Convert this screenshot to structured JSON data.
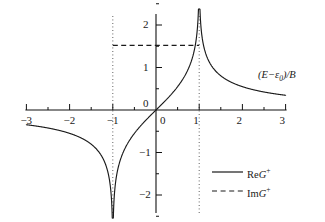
{
  "chart_data": {
    "type": "line",
    "title": "",
    "xlabel": "(E−ε₀)/B",
    "ylabel": "",
    "xlim": [
      -3,
      3
    ],
    "ylim": [
      -2.6,
      2.6
    ],
    "grid": false,
    "legend_position": "bottom-right",
    "xticks": [
      -3,
      -2,
      -1,
      0,
      1,
      2,
      3
    ],
    "xtick_labels": [
      "−3",
      "−2",
      "−1",
      "0",
      "1",
      "2",
      "3"
    ],
    "xticks_minor": [
      -2.5,
      -1.5,
      -0.5,
      0.5,
      1.5,
      2.5
    ],
    "yticks": [
      -2,
      -1,
      0,
      1,
      2
    ],
    "ytick_labels": [
      "−2",
      "−1",
      "0",
      "1",
      "2"
    ],
    "yticks_minor": [
      -2.5,
      -1.5,
      -0.5,
      0.5,
      1.5,
      2.5
    ],
    "annotations": [
      {
        "name": "singularity-line-left",
        "type": "vline",
        "x": -1,
        "style": "dotted"
      },
      {
        "name": "singularity-line-right",
        "type": "vline",
        "x": 1,
        "style": "dotted"
      }
    ],
    "series": [
      {
        "name": "ReG+",
        "style": "solid",
        "color": "#1a1a1a",
        "description": "Odd, logarithmically divergent at x=±1; →−∞ as x→−1, →+∞ as x→+1, decaying to 0 at large |x|",
        "x": [
          -3.0,
          -2.8,
          -2.6,
          -2.4,
          -2.2,
          -2.0,
          -1.8,
          -1.6,
          -1.4,
          -1.25,
          -1.15,
          -1.08,
          -1.03,
          -1.005,
          -0.995,
          -0.97,
          -0.92,
          -0.85,
          -0.75,
          -0.6,
          -0.45,
          -0.3,
          -0.15,
          0.0,
          0.15,
          0.3,
          0.45,
          0.6,
          0.75,
          0.85,
          0.92,
          0.97,
          0.995,
          1.005,
          1.03,
          1.08,
          1.15,
          1.25,
          1.4,
          1.6,
          1.8,
          2.0,
          2.2,
          2.4,
          2.6,
          2.8,
          3.0
        ],
        "y": [
          -0.35,
          -0.38,
          -0.42,
          -0.46,
          -0.52,
          -0.58,
          -0.68,
          -0.82,
          -1.05,
          -1.33,
          -1.58,
          -1.85,
          -2.2,
          -2.6,
          -2.6,
          -2.1,
          -1.65,
          -1.38,
          -1.12,
          -0.86,
          -0.66,
          -0.47,
          -0.25,
          0.0,
          0.25,
          0.47,
          0.66,
          0.86,
          1.12,
          1.38,
          1.65,
          2.1,
          2.6,
          2.6,
          2.2,
          1.85,
          1.58,
          1.33,
          1.05,
          0.82,
          0.68,
          0.58,
          0.52,
          0.46,
          0.42,
          0.38,
          0.35
        ]
      },
      {
        "name": "ImG+",
        "style": "dashed",
        "color": "#1a1a1a",
        "description": "Constant plateau of ≈π/2 on −1<x<1, zero outside the band",
        "x": [
          -1.0,
          1.0
        ],
        "y": [
          1.52,
          1.52
        ],
        "plateau_value": 1.52
      }
    ]
  },
  "axis": {
    "x_title": "(E−ε₀)/B",
    "x_title_parts": {
      "open": "(",
      "E": "E",
      "minus": "−",
      "eps": "ε",
      "eps_sub": "0",
      "close": ")/",
      "B": "B"
    }
  },
  "legend": {
    "entries": [
      {
        "key": "re",
        "label_prefix": "Re",
        "label_symbol": "G",
        "label_sup": "+",
        "style": "solid"
      },
      {
        "key": "im",
        "label_prefix": "Im",
        "label_symbol": "G",
        "label_sup": "+",
        "style": "dashed"
      }
    ]
  }
}
